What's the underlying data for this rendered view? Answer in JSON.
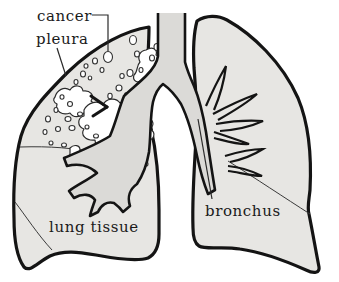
{
  "diagram": {
    "labels": {
      "cancer": "cancer",
      "pleura": "pleura",
      "lung_tissue": "lung tissue",
      "bronchus": "bronchus"
    },
    "colors": {
      "background": "#ffffff",
      "lung_fill": "#e7e6e3",
      "airway_fill": "#dbdad7",
      "outline": "#141414",
      "thin_line": "#3a3a3a",
      "tumor_fill": "#ffffff"
    }
  }
}
